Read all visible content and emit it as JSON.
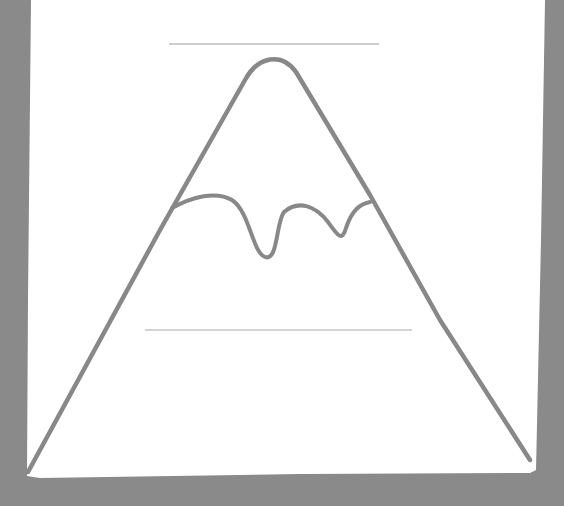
{
  "illustration": {
    "subject": "mountain-with-snow-cap",
    "background_color": "#8a8a8a",
    "paper_color": "#ffffff",
    "stroke_color": "#888888",
    "guide_line_color": "#bdbdbd",
    "guide_lines": [
      {
        "x1": 169,
        "x2": 379,
        "y": 44
      },
      {
        "x1": 145,
        "x2": 412,
        "y": 330
      }
    ]
  }
}
